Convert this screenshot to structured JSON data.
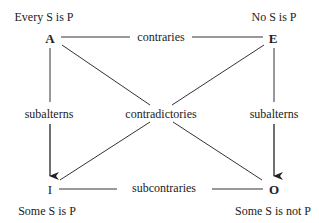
{
  "corners": {
    "A": {
      "letter": "A",
      "proposition": "Every S is P"
    },
    "E": {
      "letter": "E",
      "proposition": "No S is P"
    },
    "I": {
      "letter": "I",
      "proposition": "Some S is P"
    },
    "O": {
      "letter": "O",
      "proposition": "Some S is not P"
    }
  },
  "relations": {
    "top": "contraries",
    "bottom": "subcontraries",
    "left": "subalterns",
    "right": "subalterns",
    "diagonals": "contradictories"
  },
  "colors": {
    "line": "#333333",
    "text": "#222222",
    "background": "#ffffff"
  }
}
